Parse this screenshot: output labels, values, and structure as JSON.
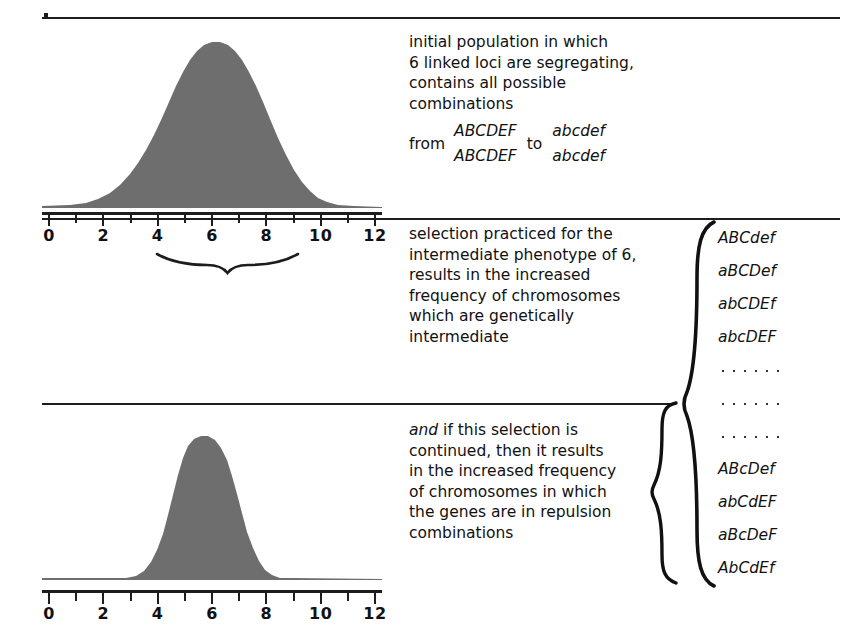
{
  "figure": {
    "background": "#ffffff",
    "curve_fill": "#6e6e6e",
    "ink": "#1d1d1d"
  },
  "axis": {
    "labels": [
      "0",
      "2",
      "4",
      "6",
      "8",
      "10",
      "12"
    ],
    "values": [
      0,
      2,
      4,
      6,
      8,
      10,
      12
    ],
    "minor_values": [
      1,
      3,
      5,
      7,
      9,
      11
    ],
    "min": 0,
    "max": 12
  },
  "panels": {
    "top": {
      "name": "initial-population-distribution",
      "selection_brace_label": "intermediate phenotype selected",
      "selection_brace_range": [
        4,
        8
      ]
    },
    "bottom": {
      "name": "selected-population-distribution"
    }
  },
  "text": {
    "initial": {
      "lines": [
        "initial population in which",
        "6 linked loci are segregating,",
        "contains all possible",
        "combinations"
      ],
      "from_word": "from",
      "to_word": "to",
      "fraction_left": {
        "numerator": "ABCDEF",
        "denominator": "ABCDEF"
      },
      "fraction_right": {
        "numerator": "abcdef",
        "denominator": "abcdef"
      }
    },
    "selection": {
      "lines": [
        "selection practiced for the",
        "intermediate phenotype of 6,",
        "results in the increased",
        "frequency of chromosomes",
        "which are genetically",
        "intermediate"
      ]
    },
    "continued": {
      "lead_italic": "and",
      "lead_rest": " if this selection is",
      "lines": [
        "continued, then it results",
        "in the increased frequency",
        "of chromosomes in which",
        "the genes are in repulsion",
        "combinations"
      ]
    }
  },
  "genotypes": {
    "upper_group": [
      "ABCdef",
      "aBCDef",
      "abCDEf",
      "abcDEF"
    ],
    "ellipsis_rows": 3,
    "dots_per_row": 6,
    "lower_group": [
      "ABcDef",
      "abCdEF",
      "aBcDeF",
      "AbCdEf"
    ]
  },
  "chart_data": {
    "type": "area",
    "xlabel": "",
    "ylabel": "frequency",
    "xlim": [
      0,
      12
    ],
    "grid": false,
    "legend": "none",
    "series": [
      {
        "name": "initial population",
        "panel": "top",
        "mean": 6,
        "sd": 1.85,
        "range": [
          1,
          11
        ],
        "peak_height": 1.0,
        "fill": "#6e6e6e"
      },
      {
        "name": "after continued selection",
        "panel": "bottom",
        "mean": 5.85,
        "sd": 0.92,
        "range": [
          3.3,
          8.1
        ],
        "peak_height": 0.95,
        "fill": "#6e6e6e"
      }
    ],
    "annotations": [
      {
        "type": "underbrace",
        "panel": "top",
        "from": 4,
        "to": 8,
        "center": 6
      }
    ]
  }
}
